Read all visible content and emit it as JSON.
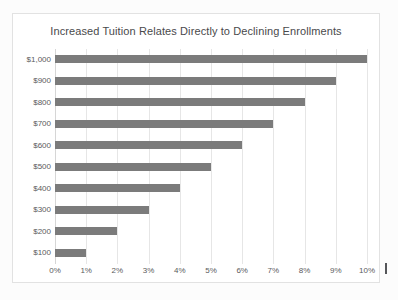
{
  "chart_data": {
    "type": "bar",
    "orientation": "horizontal",
    "title": "Increased Tuition Relates Directly to Declining Enrollments",
    "xlabel": "",
    "ylabel": "",
    "categories": [
      "$1,000",
      "$900",
      "$800",
      "$700",
      "$600",
      "$500",
      "$400",
      "$300",
      "$200",
      "$100"
    ],
    "values": [
      10,
      9,
      8,
      7,
      6,
      5,
      4,
      3,
      2,
      1
    ],
    "value_labels": [
      "10%",
      "9%",
      "8%",
      "7%",
      "6%",
      "5%",
      "4%",
      "3%",
      "2%",
      "1%"
    ],
    "xlim": [
      0,
      10
    ],
    "xticks": [
      0,
      1,
      2,
      3,
      4,
      5,
      6,
      7,
      8,
      9,
      10
    ],
    "xtick_labels": [
      "0%",
      "1%",
      "2%",
      "3%",
      "4%",
      "5%",
      "6%",
      "7%",
      "8%",
      "9%",
      "10%"
    ],
    "grid": true,
    "grid_axis": "x",
    "legend": false,
    "legend_position": "none",
    "bar_color": "#7b7b7b",
    "gridline_color": "#e6e6e6",
    "title_color": "#49494b",
    "tick_label_color": "#5a5a5c",
    "plot_background": "#ffffff",
    "frame_border_color": "#e2e2e2"
  }
}
